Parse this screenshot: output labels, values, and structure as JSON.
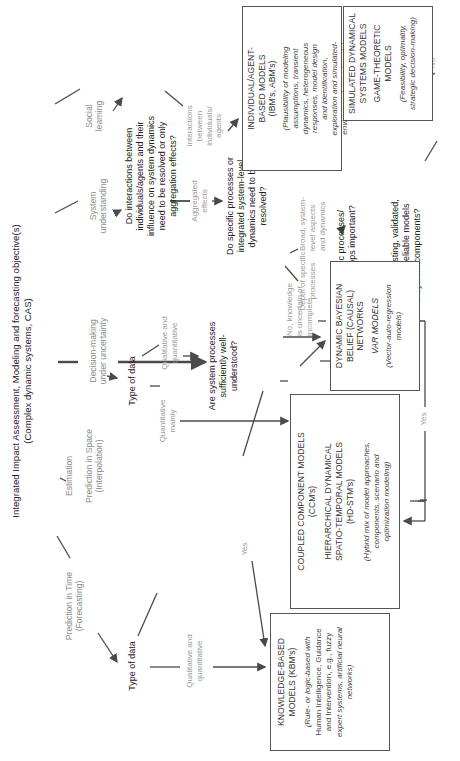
{
  "diagram": {
    "title_line1": "Integrated Impact Assessment, Modeling and forecasting objective(s)",
    "title_line2": "(Complex dynamic systems, CAS)",
    "objectives": [
      {
        "line1": "Prediction in Time",
        "line2": "(Forecasting)"
      },
      {
        "line1": "Estimation",
        "line2": ""
      },
      {
        "line1": "Prediction in Space",
        "line2": "(Interpolation)"
      },
      {
        "line1": "Decision-making",
        "line2": "under uncertainty"
      },
      {
        "line1": "System",
        "line2": "understanding"
      },
      {
        "line1": "Social",
        "line2": "learning"
      }
    ],
    "type_of_data_1": "Type of data",
    "type_of_data_2": "Type of data",
    "labels": {
      "qual_quant_1a": "Qualitative and",
      "qual_quant_1b": "quantitative",
      "quant_mainly_a": "Quantitative",
      "quant_mainly_b": "mainly",
      "qual_quant_2a": "Qualitative and",
      "qual_quant_2b": "quantitative",
      "yes_1": "Yes",
      "no_knowledge_a": "No, knowledge",
      "no_knowledge_b": "is uncertain or",
      "no_knowledge_c": "incomplete",
      "aggregated_a": "Aggregated",
      "aggregated_b": "effects",
      "interactions_a": "Interactions",
      "interactions_b": "between",
      "interactions_c": "individuals/",
      "interactions_d": "agents",
      "depth_a": "Depth of specific",
      "depth_b": "processes",
      "broad_a": "Broad, system-",
      "broad_b": "level aspects",
      "broad_c": "and dynamics",
      "no_2": "No",
      "yes_2": "Yes",
      "no_3": "No",
      "yes_3": "Yes"
    },
    "questions": {
      "well_understood": [
        "Are system processes",
        "sufficiently well-",
        "understood?"
      ],
      "interactions": [
        "Do interactions between",
        "individuals/agents and their",
        "influence on system dynamics",
        "need to be resolved or only",
        "aggregation effects?"
      ],
      "specific_processes": [
        "Do specific processes or",
        "integrated system-level",
        "dynamics need to be",
        "resolved?"
      ],
      "feedback": [
        "Are dynamic processes/",
        "feedback loops important?"
      ],
      "existing_models": [
        "Are there existing, validated,",
        "sufficiently reliable models",
        "of system components?"
      ]
    },
    "boxes": {
      "kbm": {
        "title": [
          "KNOWLEDGE-BASED",
          "MODELS (KBM's)"
        ],
        "desc": [
          "(Rule- or logic-based with",
          "Human Intelligence, Guidance",
          "and Intervention, e.g., fuzzy",
          "expert systems, artificial neural",
          "networks)"
        ]
      },
      "ccm": {
        "title1": [
          "COUPLED COMPONENT MODELS",
          "(CCM's)"
        ],
        "title2": [
          "HIERARCHICAL DYNAMICAL",
          "SPATIO-TEMPORAL MODELS",
          "(HD-STM's)"
        ],
        "desc": [
          "(Hybrid mix of model approaches,",
          "components, scenario and",
          "optimization modeling)"
        ]
      },
      "dbn": {
        "title1": [
          "DYNAMIC BAYESIAN",
          "BELIEF (CAUSAL)",
          "NETWORKS"
        ],
        "title2": [
          "VAR MODELS"
        ],
        "desc": [
          "(Vector-auto-regression",
          "models)"
        ]
      },
      "abm": {
        "title": [
          "INDIVIDUAL/AGENT-",
          "BASED MODELS",
          "(IBM's, ABM's)"
        ],
        "desc": [
          "(Plausibility of modeling",
          "assumptions, transient",
          "dynamics, heterogeneous",
          "responses, model design",
          "and identification,",
          "exploration and simulated-",
          "environment experiments)"
        ]
      },
      "sds": {
        "title1": [
          "SIMULATED DYNAMICAL",
          "SYSTEMS MODELS"
        ],
        "title2": [
          "GAME-THEORETIC",
          "MODELS"
        ],
        "desc": [
          "(Feasibility, optimality,",
          "strategic decision-making)"
        ]
      }
    },
    "colors": {
      "line": "#4a4a4a",
      "box_border": "#555555",
      "muted_text": "#9a9a9a"
    }
  }
}
